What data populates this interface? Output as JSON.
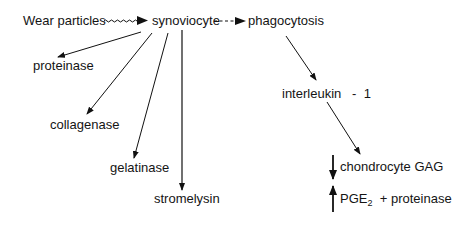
{
  "diagram": {
    "nodes": {
      "wear_particles": "Wear particles",
      "synoviocyte": "synoviocyte",
      "phagocytosis": "phagocytosis",
      "proteinase": "proteinase",
      "collagenase": "collagenase",
      "gelatinase": "gelatinase",
      "stromelysin": "stromelysin",
      "interleukin": "interleukin   -  1",
      "chondrocyte_gag": "chondrocyte GAG",
      "pge_main": "PGE",
      "pge_sub": "2",
      "pge_rest": "  + proteinase"
    },
    "edges": [
      {
        "from": "Wear particles",
        "to": "synoviocyte",
        "style": "wavy"
      },
      {
        "from": "synoviocyte",
        "to": "phagocytosis",
        "style": "dashed"
      },
      {
        "from": "synoviocyte",
        "to": "proteinase",
        "style": "solid"
      },
      {
        "from": "synoviocyte",
        "to": "collagenase",
        "style": "solid"
      },
      {
        "from": "synoviocyte",
        "to": "gelatinase",
        "style": "solid"
      },
      {
        "from": "synoviocyte",
        "to": "stromelysin",
        "style": "solid"
      },
      {
        "from": "phagocytosis",
        "to": "interleukin - 1",
        "style": "solid"
      },
      {
        "from": "interleukin - 1",
        "to": "chondrocyte GAG / PGE2 + proteinase",
        "style": "solid"
      }
    ],
    "indicators": {
      "chondrocyte_gag": "decrease",
      "pge2_proteinase": "increase"
    }
  }
}
